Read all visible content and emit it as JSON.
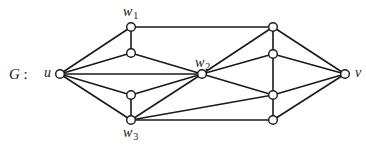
{
  "diagram": {
    "graph_name": "G",
    "graph_name_suffix": ":",
    "vertices": [
      {
        "id": "u",
        "x": 60,
        "y": 74,
        "label": "u",
        "sub": ""
      },
      {
        "id": "w1",
        "x": 131,
        "y": 27,
        "label": "w",
        "sub": "1"
      },
      {
        "id": "a",
        "x": 131,
        "y": 53,
        "label": "",
        "sub": ""
      },
      {
        "id": "b",
        "x": 131,
        "y": 95,
        "label": "",
        "sub": ""
      },
      {
        "id": "w3",
        "x": 131,
        "y": 120,
        "label": "w",
        "sub": "3"
      },
      {
        "id": "w2",
        "x": 202,
        "y": 74,
        "label": "w",
        "sub": "2"
      },
      {
        "id": "r1",
        "x": 273,
        "y": 27,
        "label": "",
        "sub": ""
      },
      {
        "id": "r2",
        "x": 273,
        "y": 54,
        "label": "",
        "sub": ""
      },
      {
        "id": "r3",
        "x": 273,
        "y": 95,
        "label": "",
        "sub": ""
      },
      {
        "id": "r4",
        "x": 273,
        "y": 120,
        "label": "",
        "sub": ""
      },
      {
        "id": "v",
        "x": 345,
        "y": 74,
        "label": "v",
        "sub": ""
      }
    ],
    "edges": [
      [
        "u",
        "w1"
      ],
      [
        "u",
        "a"
      ],
      [
        "u",
        "w2"
      ],
      [
        "u",
        "b"
      ],
      [
        "u",
        "w3"
      ],
      [
        "w1",
        "a"
      ],
      [
        "b",
        "w3"
      ],
      [
        "w1",
        "r1"
      ],
      [
        "a",
        "w2"
      ],
      [
        "b",
        "w2"
      ],
      [
        "w3",
        "w2"
      ],
      [
        "w3",
        "r3"
      ],
      [
        "w3",
        "r4"
      ],
      [
        "w2",
        "r1"
      ],
      [
        "w2",
        "r2"
      ],
      [
        "w2",
        "r3"
      ],
      [
        "r1",
        "r2"
      ],
      [
        "r2",
        "r3"
      ],
      [
        "r3",
        "r4"
      ],
      [
        "r1",
        "v"
      ],
      [
        "r2",
        "v"
      ],
      [
        "r3",
        "v"
      ],
      [
        "r4",
        "v"
      ]
    ],
    "labels": {
      "u": {
        "text": "u",
        "sub": ""
      },
      "v": {
        "text": "v",
        "sub": ""
      },
      "w1": {
        "text": "w",
        "sub": "1"
      },
      "w2": {
        "text": "w",
        "sub": "2"
      },
      "w3": {
        "text": "w",
        "sub": "3"
      }
    }
  }
}
